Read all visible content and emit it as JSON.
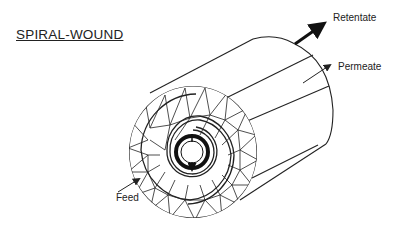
{
  "title": "SPIRAL-WOUND",
  "labels": {
    "retentate": "Retentate",
    "permeate": "Permeate",
    "feed": "Feed"
  },
  "colors": {
    "line": "#222222",
    "background": "#ffffff"
  },
  "icons": {
    "retentate_arrow": "thick-arrow-up-right",
    "permeate_arrow": "thin-arrow-up-right",
    "feed_arrow": "thin-arrow-up-right"
  }
}
